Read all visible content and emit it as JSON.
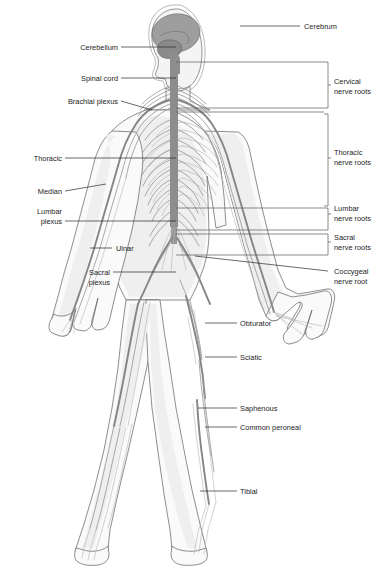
{
  "figure": {
    "background_color": "#ffffff",
    "width": 389,
    "height": 582
  },
  "labels_left": [
    {
      "id": "cerebellum",
      "text": "Cerebellum",
      "text_x": 118,
      "text_y": 50,
      "line": "121,47 L 176,47"
    },
    {
      "id": "spinal-cord",
      "text": "Spinal cord",
      "text_x": 118,
      "text_y": 81,
      "line": "121,78 L 176,78"
    },
    {
      "id": "brachial-plexus",
      "text": "Brachial plexus",
      "text_x": 118,
      "text_y": 104,
      "line": "121,101 L 152,109 L 152,109"
    },
    {
      "id": "thoracic",
      "text": "Thoracic",
      "text_x": 62,
      "text_y": 161,
      "line": "65,158 L 176,158"
    },
    {
      "id": "median",
      "text": "Median",
      "text_x": 62,
      "text_y": 194,
      "line": "65,191 L 100,186"
    },
    {
      "id": "lumbar-plexus-1",
      "text": "Lumbar",
      "text_x": 62,
      "text_y": 214,
      "line": ""
    },
    {
      "id": "lumbar-plexus-2",
      "text": "plexus",
      "text_x": 62,
      "text_y": 224,
      "line": "65,221 L 176,221"
    },
    {
      "id": "ulnar",
      "text": "Ulnar",
      "text_x": 128,
      "text_y": 251,
      "line": "",
      "line_right": "90,248 L 112,248"
    },
    {
      "id": "sacral-plexus-1",
      "text": "Sacral",
      "text_x": 110,
      "text_y": 275,
      "line": ""
    },
    {
      "id": "sacral-plexus-2",
      "text": "plexus",
      "text_x": 110,
      "text_y": 285,
      "line": "113,272 L 176,272"
    }
  ],
  "labels_right": [
    {
      "id": "cerebrum",
      "text": "Cerebrum",
      "text_x": 332,
      "text_y": 29,
      "line": "300,26 L 240,26"
    },
    {
      "id": "obturator",
      "text": "Obturator",
      "text_x": 240,
      "text_y": 326,
      "line": "237,323 L 205,323"
    },
    {
      "id": "sciatic",
      "text": "Sciatic",
      "text_x": 240,
      "text_y": 360,
      "line": "237,357 L 205,357"
    },
    {
      "id": "saphenous",
      "text": "Saphenous",
      "text_x": 240,
      "text_y": 411,
      "line": "237,408 L 198,408"
    },
    {
      "id": "common-peroneal",
      "text": "Common peroneal",
      "text_x": 240,
      "text_y": 430,
      "line": "237,427 L 205,427"
    },
    {
      "id": "tibial",
      "text": "Tibial",
      "text_x": 240,
      "text_y": 494,
      "line": "237,491 L 200,491"
    }
  ],
  "nerve_root_groups": [
    {
      "id": "cervical",
      "line1": "Cervical",
      "line2": "nerve roots",
      "text_x": 332,
      "text_y1": 84,
      "text_y2": 94,
      "bracket_top": 62,
      "bracket_bottom": 110,
      "bracket_x": 324,
      "tick_y": 86,
      "rules": [
        "176,62 L 324,62",
        "176,108 L 324,108",
        "176,112 L 324,112"
      ]
    },
    {
      "id": "thoracic",
      "line1": "Thoracic",
      "line2": "nerve roots",
      "text_x": 332,
      "text_y1": 155,
      "text_y2": 165,
      "bracket_top": 114,
      "bracket_bottom": 208,
      "bracket_x": 324,
      "tick_y": 160,
      "rules": []
    },
    {
      "id": "lumbar",
      "line1": "Lumbar",
      "line2": "nerve roots",
      "text_x": 332,
      "text_y1": 211,
      "text_y2": 221,
      "bracket_top": 208,
      "bracket_bottom": 231,
      "bracket_x": 324,
      "tick_y": 214,
      "rules": [
        "176,208 L 324,208",
        "176,230 L 324,230"
      ]
    },
    {
      "id": "sacral",
      "line1": "Sacral",
      "line2": "nerve roots",
      "text_x": 332,
      "text_y1": 240,
      "text_y2": 250,
      "bracket_top": 234,
      "bracket_bottom": 256,
      "bracket_x": 324,
      "tick_y": 242,
      "rules": [
        "176,234 L 324,234",
        "176,255 L 324,255"
      ]
    },
    {
      "id": "coccygeal",
      "line1": "Coccygeal",
      "line2": "nerve root",
      "text_x": 332,
      "text_y1": 274,
      "text_y2": 284,
      "bracket_top": null,
      "bracket_bottom": null,
      "bracket_x": null,
      "tick_y": null,
      "rules": [],
      "leader": "324,271 L 195,258"
    }
  ],
  "colors": {
    "text": "#1d1d1d",
    "leader_line": "#2a2a2a",
    "bracket": "#5a5a5a",
    "body_outline": "#5e5e5e",
    "body_fill": "#fafafa",
    "body_shade": "#efefef",
    "nerve": "#9a9a9a",
    "nerve_major": "#858585",
    "spinal_cord": "#8d8d8d",
    "cerebrum": "#9e9e9e",
    "cerebellum": "#8a8a8a",
    "rib": "#b9b9b9"
  }
}
